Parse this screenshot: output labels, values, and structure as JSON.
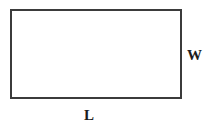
{
  "figure": {
    "shape": "rectangle",
    "background_color": "#ffffff",
    "stroke_color": "#3b3b3b",
    "label_color": "#1c1c1c"
  },
  "labels": {
    "width": "W",
    "length": "L"
  }
}
